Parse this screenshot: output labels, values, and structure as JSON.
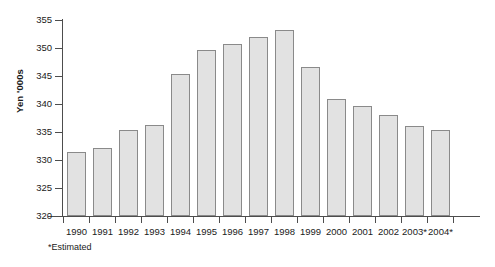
{
  "chart_data": {
    "type": "bar",
    "title": "",
    "xlabel": "",
    "ylabel": "Yen '000s",
    "ylim": [
      320,
      355
    ],
    "ytick_step": 5,
    "yticks": [
      320,
      325,
      330,
      335,
      340,
      345,
      350,
      355
    ],
    "grid": false,
    "legend": "none",
    "categories": [
      "1990",
      "1991",
      "1992",
      "1993",
      "1994",
      "1995",
      "1996",
      "1997",
      "1998",
      "1999",
      "2000",
      "2001",
      "2002",
      "2003*",
      "2004*"
    ],
    "values": [
      331.5,
      332.2,
      335.3,
      336.3,
      345.4,
      349.7,
      350.7,
      351.9,
      353.3,
      346.6,
      340.9,
      339.6,
      338.0,
      336.0,
      335.3
    ],
    "annotations": [
      "*Estimated"
    ]
  },
  "axes": {
    "y_title": "Yen '000s"
  },
  "footnote": {
    "text": "*Estimated"
  },
  "colors": {
    "bar_fill": "#e2e2e2",
    "bar_border": "#8a8a8a",
    "axis": "#4d4d4d",
    "background": "#ffffff",
    "text": "#1a1a1a"
  }
}
